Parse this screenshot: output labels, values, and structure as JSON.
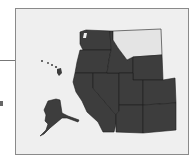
{
  "map": {
    "title": "",
    "region": "Western United States",
    "colors": {
      "background": "#efefef",
      "frame": "#8a8a8a",
      "state_fill": "#3d3d3d",
      "highlight_fill": "#e4e4e4",
      "border": "#1e1e1e"
    },
    "highlighted_state": "Montana",
    "states": [
      "Washington",
      "Oregon",
      "California",
      "Nevada",
      "Idaho",
      "Montana",
      "Wyoming",
      "Utah",
      "Colorado",
      "Arizona",
      "New Mexico",
      "Alaska",
      "Hawaii"
    ]
  }
}
